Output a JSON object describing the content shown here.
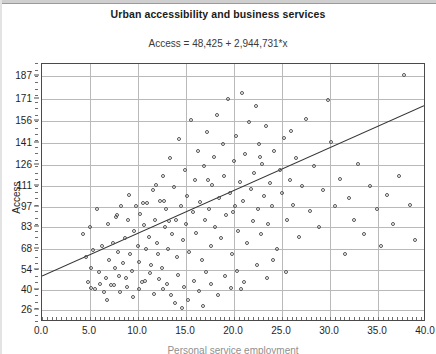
{
  "chart_data": {
    "type": "scatter",
    "title": "Urban accessibility and business services",
    "subtitle": "Access = 48,425 + 2,944,731*x",
    "xlabel": "Personal service employment",
    "ylabel": "Access",
    "xlim": [
      0.0,
      40.0
    ],
    "ylim": [
      18.0,
      195.0
    ],
    "xticks": [
      "0.0",
      "5.0",
      "10.0",
      "15.0",
      "20.0",
      "25.0",
      "30.0",
      "35.0",
      "40.0"
    ],
    "xtick_values": [
      0.0,
      5.0,
      10.0,
      15.0,
      20.0,
      25.0,
      30.0,
      35.0,
      40.0
    ],
    "yticks": [
      "187",
      "171",
      "156",
      "141",
      "126",
      "111",
      "97",
      "83",
      "68",
      "54",
      "40",
      "26"
    ],
    "ytick_values": [
      187,
      171,
      156,
      141,
      126,
      111,
      97,
      83,
      68,
      54,
      40,
      26
    ],
    "grid": true,
    "legend": false,
    "marker": "open-circle",
    "marker_color": "#555555",
    "regression_line": {
      "intercept": 48.425,
      "slope": 2.944731,
      "color": "#333333",
      "x_start": 0.0,
      "x_end": 40.0,
      "y_start": 48.4,
      "y_end": 166.2
    },
    "points": [
      [
        4.3,
        78
      ],
      [
        4.6,
        62
      ],
      [
        4.8,
        45
      ],
      [
        5.0,
        83
      ],
      [
        5.1,
        55
      ],
      [
        5.2,
        41
      ],
      [
        5.4,
        67
      ],
      [
        5.6,
        40
      ],
      [
        5.8,
        95
      ],
      [
        6.0,
        52
      ],
      [
        6.1,
        44
      ],
      [
        6.3,
        70
      ],
      [
        6.5,
        38
      ],
      [
        6.7,
        48
      ],
      [
        6.9,
        85
      ],
      [
        7.0,
        60
      ],
      [
        7.2,
        43
      ],
      [
        7.4,
        72
      ],
      [
        7.6,
        55
      ],
      [
        7.8,
        90
      ],
      [
        8.0,
        66
      ],
      [
        8.1,
        49
      ],
      [
        8.3,
        97
      ],
      [
        8.5,
        58
      ],
      [
        8.7,
        75
      ],
      [
        8.9,
        42
      ],
      [
        9.0,
        88
      ],
      [
        9.2,
        64
      ],
      [
        9.4,
        53
      ],
      [
        9.6,
        80
      ],
      [
        9.8,
        97
      ],
      [
        10.0,
        70
      ],
      [
        10.1,
        59
      ],
      [
        10.3,
        92
      ],
      [
        10.5,
        45
      ],
      [
        10.7,
        84
      ],
      [
        10.9,
        68
      ],
      [
        11.0,
        99
      ],
      [
        11.2,
        76
      ],
      [
        11.4,
        57
      ],
      [
        11.6,
        108
      ],
      [
        11.8,
        88
      ],
      [
        12.0,
        72
      ],
      [
        12.1,
        64
      ],
      [
        12.3,
        101
      ],
      [
        12.5,
        55
      ],
      [
        12.7,
        118
      ],
      [
        12.9,
        83
      ],
      [
        13.0,
        95
      ],
      [
        13.2,
        68
      ],
      [
        13.4,
        130
      ],
      [
        13.6,
        78
      ],
      [
        13.8,
        110
      ],
      [
        14.0,
        88
      ],
      [
        14.1,
        62
      ],
      [
        14.3,
        143
      ],
      [
        14.5,
        97
      ],
      [
        14.7,
        74
      ],
      [
        14.9,
        122
      ],
      [
        15.0,
        85
      ],
      [
        15.2,
        104
      ],
      [
        15.4,
        66
      ],
      [
        15.6,
        156
      ],
      [
        15.8,
        93
      ],
      [
        16.0,
        115
      ],
      [
        16.1,
        79
      ],
      [
        16.3,
        135
      ],
      [
        16.5,
        100
      ],
      [
        16.7,
        60
      ],
      [
        16.9,
        125
      ],
      [
        17.0,
        88
      ],
      [
        17.2,
        148
      ],
      [
        17.4,
        95
      ],
      [
        17.6,
        70
      ],
      [
        17.8,
        112
      ],
      [
        18.0,
        131
      ],
      [
        18.1,
        83
      ],
      [
        18.3,
        160
      ],
      [
        18.5,
        103
      ],
      [
        18.7,
        75
      ],
      [
        18.9,
        140
      ],
      [
        19.0,
        118
      ],
      [
        19.2,
        91
      ],
      [
        19.4,
        171
      ],
      [
        19.6,
        106
      ],
      [
        19.8,
        64
      ],
      [
        20.0,
        128
      ],
      [
        20.1,
        97
      ],
      [
        20.3,
        145
      ],
      [
        20.5,
        80
      ],
      [
        20.7,
        114
      ],
      [
        20.9,
        175
      ],
      [
        21.0,
        101
      ],
      [
        21.2,
        133
      ],
      [
        21.4,
        72
      ],
      [
        21.6,
        155
      ],
      [
        21.8,
        109
      ],
      [
        22.0,
        87
      ],
      [
        22.1,
        120
      ],
      [
        22.3,
        166
      ],
      [
        22.5,
        95
      ],
      [
        22.7,
        140
      ],
      [
        22.9,
        78
      ],
      [
        23.0,
        126
      ],
      [
        23.2,
        104
      ],
      [
        23.4,
        152
      ],
      [
        23.6,
        85
      ],
      [
        23.8,
        113
      ],
      [
        24.0,
        97
      ],
      [
        24.2,
        135
      ],
      [
        24.5,
        68
      ],
      [
        24.8,
        122
      ],
      [
        25.0,
        106
      ],
      [
        25.3,
        144
      ],
      [
        25.6,
        88
      ],
      [
        25.9,
        115
      ],
      [
        26.2,
        98
      ],
      [
        26.5,
        130
      ],
      [
        26.8,
        76
      ],
      [
        27.1,
        111
      ],
      [
        27.5,
        157
      ],
      [
        28.0,
        94
      ],
      [
        28.4,
        125
      ],
      [
        28.9,
        83
      ],
      [
        29.3,
        108
      ],
      [
        29.8,
        170
      ],
      [
        30.2,
        141
      ],
      [
        30.6,
        97
      ],
      [
        31.1,
        116
      ],
      [
        31.6,
        64
      ],
      [
        32.0,
        103
      ],
      [
        32.5,
        88
      ],
      [
        33.0,
        126
      ],
      [
        33.6,
        78
      ],
      [
        34.2,
        111
      ],
      [
        34.9,
        95
      ],
      [
        35.4,
        70
      ],
      [
        36.0,
        105
      ],
      [
        36.6,
        85
      ],
      [
        37.2,
        118
      ],
      [
        37.8,
        187
      ],
      [
        38.4,
        98
      ],
      [
        38.9,
        74
      ],
      [
        12.2,
        47
      ],
      [
        12.6,
        40
      ],
      [
        13.1,
        44
      ],
      [
        13.5,
        36
      ],
      [
        14.2,
        50
      ],
      [
        14.8,
        42
      ],
      [
        15.3,
        33
      ],
      [
        15.9,
        46
      ],
      [
        16.4,
        39
      ],
      [
        17.1,
        52
      ],
      [
        17.7,
        44
      ],
      [
        18.4,
        36
      ],
      [
        19.1,
        49
      ],
      [
        19.7,
        41
      ],
      [
        11.3,
        51
      ],
      [
        11.7,
        37
      ],
      [
        10.8,
        46
      ],
      [
        10.2,
        40
      ],
      [
        9.5,
        35
      ],
      [
        8.8,
        48
      ],
      [
        8.2,
        38
      ],
      [
        7.5,
        43
      ],
      [
        6.8,
        33
      ],
      [
        20.4,
        53
      ],
      [
        21.1,
        45
      ],
      [
        22.4,
        57
      ],
      [
        23.5,
        48
      ],
      [
        20.8,
        40
      ],
      [
        24.1,
        60
      ],
      [
        25.5,
        52
      ],
      [
        13.9,
        31
      ],
      [
        16.8,
        29
      ],
      [
        14.6,
        27
      ],
      [
        12.8,
        101
      ],
      [
        17.3,
        115
      ],
      [
        19.9,
        93
      ],
      [
        22.8,
        131
      ],
      [
        26.0,
        149
      ],
      [
        9.1,
        105
      ],
      [
        10.6,
        99
      ],
      [
        11.9,
        112
      ],
      [
        13.3,
        87
      ],
      [
        7.9,
        91
      ]
    ]
  }
}
